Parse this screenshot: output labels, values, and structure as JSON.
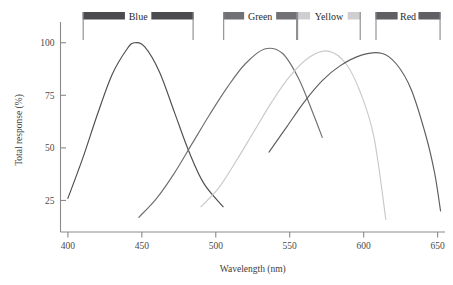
{
  "chart_data": {
    "type": "line",
    "title": "",
    "xlabel": "Wavelength (nm)",
    "ylabel": "Total response (%)",
    "xlim": [
      395,
      655
    ],
    "ylim": [
      10,
      107
    ],
    "grid": false,
    "legend_position": "top-bands",
    "xticks": [
      400,
      450,
      500,
      550,
      600,
      650
    ],
    "xtick_labels": [
      "400",
      "450",
      "500",
      "550",
      "600",
      "650"
    ],
    "yticks": [
      25,
      50,
      75,
      100
    ],
    "ytick_labels": [
      "25",
      "50",
      "75",
      "100"
    ],
    "series": [
      {
        "name": "Blue",
        "color": "#4d4d52",
        "peak_x": 445,
        "peak_y": 100,
        "x_start": 400,
        "x_end": 505,
        "y_start": 26,
        "y_end": 22,
        "width": 38,
        "band_start": 410,
        "band_end": 485,
        "band_color": "#4b4b50",
        "points": [
          {
            "x": 400,
            "y": 26
          },
          {
            "x": 410,
            "y": 45
          },
          {
            "x": 420,
            "y": 66
          },
          {
            "x": 430,
            "y": 85
          },
          {
            "x": 440,
            "y": 97
          },
          {
            "x": 445,
            "y": 100
          },
          {
            "x": 452,
            "y": 98
          },
          {
            "x": 462,
            "y": 86
          },
          {
            "x": 472,
            "y": 67
          },
          {
            "x": 482,
            "y": 48
          },
          {
            "x": 492,
            "y": 33
          },
          {
            "x": 505,
            "y": 22
          }
        ]
      },
      {
        "name": "Green",
        "color": "#6e6e73",
        "peak_x": 533,
        "peak_y": 97,
        "x_start": 448,
        "x_end": 572,
        "y_start": 17,
        "y_end": 49,
        "width": 42,
        "band_start": 505,
        "band_end": 555,
        "band_color": "#707075",
        "points": [
          {
            "x": 448,
            "y": 17
          },
          {
            "x": 460,
            "y": 26
          },
          {
            "x": 472,
            "y": 38
          },
          {
            "x": 484,
            "y": 52
          },
          {
            "x": 496,
            "y": 66
          },
          {
            "x": 508,
            "y": 79
          },
          {
            "x": 520,
            "y": 90
          },
          {
            "x": 533,
            "y": 97
          },
          {
            "x": 545,
            "y": 95
          },
          {
            "x": 556,
            "y": 83
          },
          {
            "x": 566,
            "y": 66
          },
          {
            "x": 572,
            "y": 55
          }
        ]
      },
      {
        "name": "Yellow",
        "color": "#c9c9cc",
        "peak_x": 576,
        "peak_y": 96,
        "x_start": 490,
        "x_end": 615,
        "y_start": 22,
        "y_end": 16,
        "width": 44,
        "band_start": 555,
        "band_end": 598,
        "band_color": "#cfcfd2",
        "points": [
          {
            "x": 490,
            "y": 22
          },
          {
            "x": 502,
            "y": 31
          },
          {
            "x": 514,
            "y": 44
          },
          {
            "x": 526,
            "y": 58
          },
          {
            "x": 538,
            "y": 72
          },
          {
            "x": 550,
            "y": 84
          },
          {
            "x": 563,
            "y": 93
          },
          {
            "x": 576,
            "y": 96
          },
          {
            "x": 588,
            "y": 90
          },
          {
            "x": 598,
            "y": 76
          },
          {
            "x": 607,
            "y": 55
          },
          {
            "x": 615,
            "y": 16
          }
        ]
      },
      {
        "name": "Red",
        "color": "#5d5d62",
        "peak_x": 612,
        "peak_y": 95,
        "x_start": 536,
        "x_end": 652,
        "y_start": 48,
        "y_end": 20,
        "width": 46,
        "band_start": 608,
        "band_end": 652,
        "band_color": "#5f5f64",
        "points": [
          {
            "x": 536,
            "y": 48
          },
          {
            "x": 548,
            "y": 60
          },
          {
            "x": 560,
            "y": 72
          },
          {
            "x": 572,
            "y": 82
          },
          {
            "x": 584,
            "y": 89
          },
          {
            "x": 598,
            "y": 94
          },
          {
            "x": 612,
            "y": 95
          },
          {
            "x": 622,
            "y": 90
          },
          {
            "x": 632,
            "y": 78
          },
          {
            "x": 642,
            "y": 56
          },
          {
            "x": 648,
            "y": 38
          },
          {
            "x": 652,
            "y": 20
          }
        ]
      }
    ]
  },
  "axis": {
    "x_title": "Wavelength (nm)",
    "y_title": "Total response (%)"
  },
  "bands": [
    {
      "label": "Blue"
    },
    {
      "label": "Green"
    },
    {
      "label": "Yellow"
    },
    {
      "label": "Red"
    }
  ]
}
